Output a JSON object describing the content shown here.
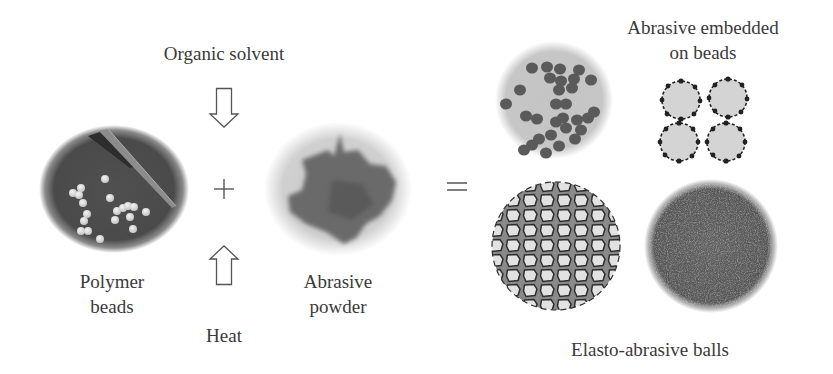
{
  "diagram": {
    "inputs": {
      "process_top_label": "Organic solvent",
      "process_bottom_label": "Heat",
      "operator_plus": "+",
      "operator_equals": "=",
      "polymer_beads": {
        "line1": "Polymer",
        "line2": "beads"
      },
      "abrasive_powder": {
        "line1": "Abrasive",
        "line2": "powder"
      }
    },
    "outputs": {
      "embedded_label": {
        "line1": "Abrasive embedded",
        "line2": "on beads"
      },
      "result_label": "Elasto-abrasive balls"
    },
    "icons": {
      "arrow_down": "hollow-down-arrow",
      "arrow_up": "hollow-up-arrow"
    },
    "colors": {
      "text": "#3a3a3a",
      "dark_fill": "#555555",
      "light_fill": "#d6d6d6",
      "background": "#ffffff"
    }
  }
}
